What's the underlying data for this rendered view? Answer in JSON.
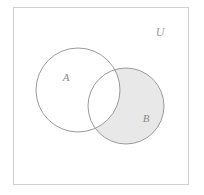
{
  "figure": {
    "type": "venn-diagram",
    "title": "",
    "background_color": "#ffffff"
  },
  "universe": {
    "label": "U",
    "label_x": 160,
    "label_y": 33,
    "border_color": "#cfcfcf",
    "fill_color": "#ffffff",
    "rect": {
      "x": 13,
      "y": 7,
      "width": 175,
      "height": 177
    }
  },
  "sets": [
    {
      "id": "A",
      "label": "A",
      "label_x": 66,
      "label_y": 78,
      "cx": 78,
      "cy": 90,
      "r": 42,
      "fill_color": "#ffffff",
      "stroke_color": "#9a9a9a"
    },
    {
      "id": "B",
      "label": "B",
      "label_x": 146,
      "label_y": 119,
      "cx": 126,
      "cy": 106,
      "r": 38,
      "fill_color": "#e8e8e8",
      "stroke_color": "#9a9a9a"
    }
  ],
  "shading": {
    "region": "B minus A",
    "description": "Only the part of B outside A is shaded; the intersection A and B is unshaded (white).",
    "shaded_color": "#e8e8e8",
    "unshaded_color": "#ffffff"
  },
  "chart_data": {
    "type": "venn",
    "title": "",
    "sets": [
      "A",
      "B"
    ],
    "universe_label": "U",
    "shaded_regions": [
      "B\\A"
    ],
    "unshaded_regions": [
      "A\\B",
      "A∩B",
      "U\\(A∪B)"
    ],
    "geometry": {
      "A": {
        "cx": 78,
        "cy": 90,
        "r": 42
      },
      "B": {
        "cx": 126,
        "cy": 106,
        "r": 38
      },
      "universe_rect": {
        "x": 13,
        "y": 7,
        "width": 175,
        "height": 177
      }
    }
  }
}
